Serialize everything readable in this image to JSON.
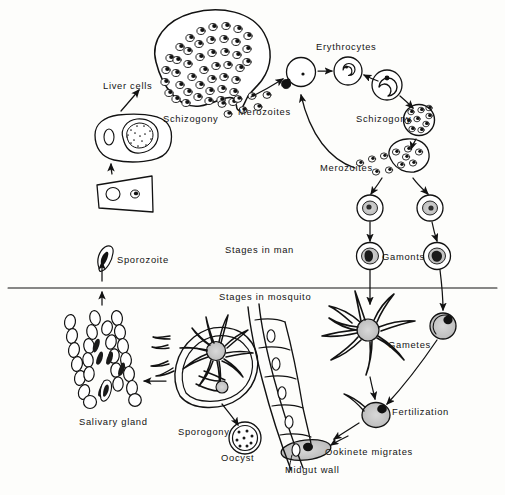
{
  "figure": {
    "type": "biological-life-cycle-diagram",
    "style": "black-and-white line drawing",
    "divider": "horizontal line separating human host stages (above) from mosquito vector stages (below)"
  },
  "sections": {
    "man": {
      "title": "Stages in man",
      "title_x": 255,
      "title_y": 253
    },
    "mosquito": {
      "title": "Stages in mosquito",
      "title_x": 257,
      "title_y": 299
    }
  },
  "labels": [
    {
      "id": "liver-cells",
      "text": "Liver cells",
      "x": 103,
      "y": 89,
      "anchor": "start"
    },
    {
      "id": "schizogony-liver",
      "text": "Schizogony",
      "x": 163,
      "y": 122,
      "anchor": "start"
    },
    {
      "id": "merozoites-liver",
      "text": "Merozoites",
      "x": 238,
      "y": 115,
      "anchor": "start"
    },
    {
      "id": "erythrocytes",
      "text": "Erythrocytes",
      "x": 316,
      "y": 50,
      "anchor": "start"
    },
    {
      "id": "schizogony-blood",
      "text": "Schizogony",
      "x": 356,
      "y": 122,
      "anchor": "start"
    },
    {
      "id": "merozoites-blood",
      "text": "Merozoites",
      "x": 320,
      "y": 171,
      "anchor": "start"
    },
    {
      "id": "gamonts",
      "text": "Gamonts",
      "x": 382,
      "y": 254,
      "anchor": "start"
    },
    {
      "id": "stages-in-man",
      "text": "Stages in man",
      "x": 225,
      "y": 253,
      "anchor": "start"
    },
    {
      "id": "sporozoite",
      "text": "Sporozoite",
      "x": 117,
      "y": 263,
      "anchor": "start"
    },
    {
      "id": "stages-in-mosquito",
      "text": "Stages in mosquito",
      "x": 219,
      "y": 300,
      "anchor": "start"
    },
    {
      "id": "gametes",
      "text": "Gametes",
      "x": 388,
      "y": 348,
      "anchor": "start"
    },
    {
      "id": "fertilization",
      "text": "Fertilization",
      "x": 392,
      "y": 415,
      "anchor": "start"
    },
    {
      "id": "salivary-gland",
      "text": "Salivary gland",
      "x": 79,
      "y": 425,
      "anchor": "start"
    },
    {
      "id": "sporogony",
      "text": "Sporogony",
      "x": 178,
      "y": 435,
      "anchor": "start"
    },
    {
      "id": "oocyst",
      "text": "Oocyst",
      "x": 221,
      "y": 461,
      "anchor": "start"
    },
    {
      "id": "ookinete-migrates",
      "text": "Ookinete migrates",
      "x": 325,
      "y": 455,
      "anchor": "start"
    },
    {
      "id": "midgut-wall",
      "text": "Midgut wall",
      "x": 285,
      "y": 473,
      "anchor": "start"
    }
  ],
  "colors": {
    "ink": "#121212",
    "paper": "#fdfdfb",
    "stipple_fill": "#c9c9c9",
    "cell_fill": "#ffffff"
  }
}
